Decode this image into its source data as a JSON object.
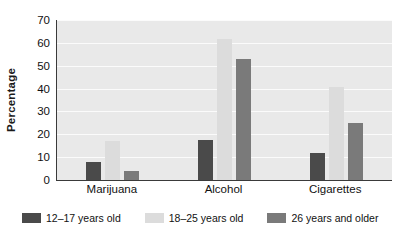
{
  "chart_data": {
    "type": "bar",
    "title": "",
    "subtitle": "",
    "xlabel": "",
    "ylabel": "Percentage",
    "categories": [
      "Marijuana",
      "Alcohol",
      "Cigarettes"
    ],
    "series": [
      {
        "name": "12–17 years old",
        "color": "#4a4a4a",
        "values": [
          8,
          17.5,
          12
        ]
      },
      {
        "name": "18–25 years old",
        "color": "#dcdcdc",
        "values": [
          17,
          61.5,
          40.5
        ]
      },
      {
        "name": "26 years and older",
        "color": "#7a7a7a",
        "values": [
          4,
          53,
          25
        ]
      }
    ],
    "ylim": [
      0,
      70
    ],
    "ytick_labels": [
      "0",
      "10",
      "20",
      "30",
      "40",
      "50",
      "60",
      "70"
    ],
    "ytick_values": [
      0,
      10,
      20,
      30,
      40,
      50,
      60,
      70
    ],
    "grid": true,
    "grid_color": "#fbfbfb",
    "plot_background": "#e9e9e9",
    "axis_color": "#3a3a3a",
    "legend_position": "bottom"
  }
}
